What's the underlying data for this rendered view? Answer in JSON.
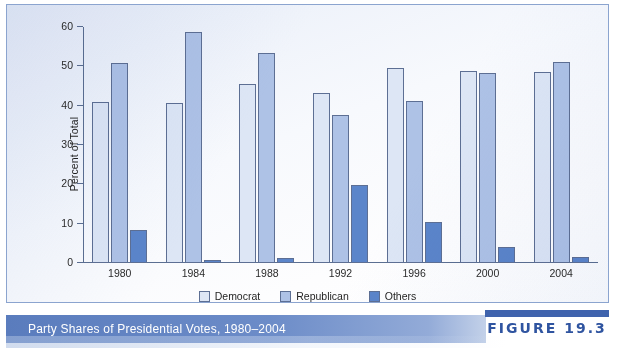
{
  "caption": {
    "title": "Party Shares of Presidential Votes, 1980–2004",
    "figure_number": "FIGURE 19.3"
  },
  "chart_data": {
    "type": "bar",
    "title": "Party Shares of Presidential Votes, 1980–2004",
    "xlabel": "",
    "ylabel": "Percent of Total",
    "ylim": [
      0,
      60
    ],
    "yticks": [
      0,
      10,
      20,
      30,
      40,
      50,
      60
    ],
    "ytick_labels": [
      "0",
      "10",
      "20",
      "30",
      "40",
      "50",
      "60"
    ],
    "grid": false,
    "legend_position": "bottom-center",
    "categories": [
      "1980",
      "1984",
      "1988",
      "1992",
      "1996",
      "2000",
      "2004"
    ],
    "series": [
      {
        "name": "Democrat",
        "color": "#dde6f5",
        "values": [
          41.0,
          40.6,
          45.6,
          43.3,
          49.6,
          48.9,
          48.5
        ]
      },
      {
        "name": "Republican",
        "color": "#aec2e6",
        "values": [
          50.8,
          58.8,
          53.5,
          37.7,
          41.3,
          48.4,
          51.0
        ]
      },
      {
        "name": "Others",
        "color": "#5b85ca",
        "values": [
          8.4,
          0.8,
          1.2,
          19.8,
          10.5,
          4.1,
          1.6
        ]
      }
    ]
  }
}
